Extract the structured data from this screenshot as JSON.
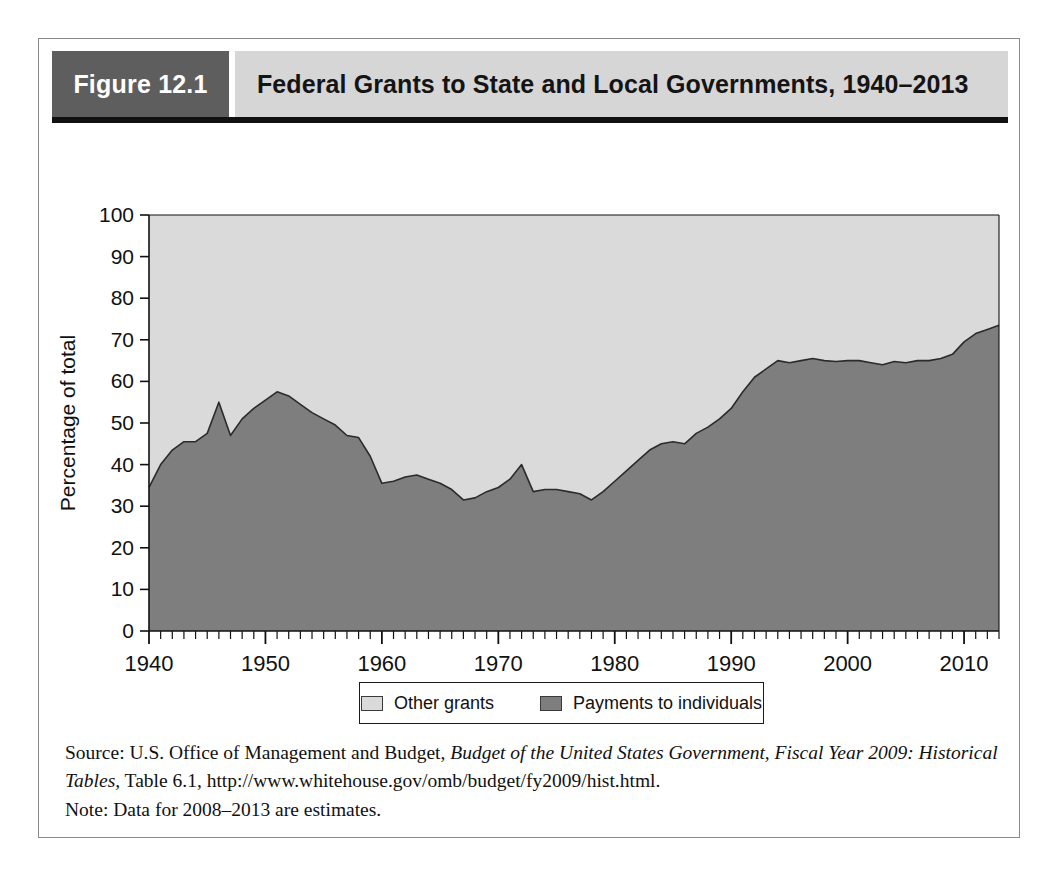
{
  "figure": {
    "number_label": "Figure 12.1",
    "title": "Federal Grants to State and Local Governments, 1940–2013"
  },
  "legend": {
    "items": [
      {
        "label": "Other grants",
        "color": "#dadada",
        "swatch_name": "other-grants-swatch"
      },
      {
        "label": "Payments to individuals",
        "color": "#7e7e7e",
        "swatch_name": "payments-to-individuals-swatch"
      }
    ]
  },
  "source": {
    "prefix": "Source: U.S. Office of Management and Budget, ",
    "italic_title": "Budget of the United States Government, Fiscal Year 2009: Historical Tables,",
    "suffix": " Table 6.1, http://www.whitehouse.gov/omb/budget/fy2009/hist.html.",
    "note": "Note: Data for 2008–2013 are estimates."
  },
  "chart_data": {
    "type": "area",
    "stacked": true,
    "title": "Federal Grants to State and Local Governments, 1940–2013",
    "xlabel": "",
    "ylabel": "Percentage of total",
    "xlim": [
      1940,
      2013
    ],
    "ylim": [
      0,
      100
    ],
    "grid": false,
    "legend_position": "bottom",
    "x_major_ticks": [
      1940,
      1950,
      1960,
      1970,
      1980,
      1990,
      2000,
      2010
    ],
    "x_tick_labels": [
      "1940",
      "1950",
      "1960",
      "1970",
      "1980",
      "1990",
      "2000",
      "2010"
    ],
    "x_minor_tick_interval": 1,
    "y_ticks": [
      0,
      10,
      20,
      30,
      40,
      50,
      60,
      70,
      80,
      90,
      100
    ],
    "y_tick_labels": [
      "0",
      "10",
      "20",
      "30",
      "40",
      "50",
      "60",
      "70",
      "80",
      "90",
      "100"
    ],
    "x": [
      1940,
      1941,
      1942,
      1943,
      1944,
      1945,
      1946,
      1947,
      1948,
      1949,
      1950,
      1951,
      1952,
      1953,
      1954,
      1955,
      1956,
      1957,
      1958,
      1959,
      1960,
      1961,
      1962,
      1963,
      1964,
      1965,
      1966,
      1967,
      1968,
      1969,
      1970,
      1971,
      1972,
      1973,
      1974,
      1975,
      1976,
      1977,
      1978,
      1979,
      1980,
      1981,
      1982,
      1983,
      1984,
      1985,
      1986,
      1987,
      1988,
      1989,
      1990,
      1991,
      1992,
      1993,
      1994,
      1995,
      1996,
      1997,
      1998,
      1999,
      2000,
      2001,
      2002,
      2003,
      2004,
      2005,
      2006,
      2007,
      2008,
      2009,
      2010,
      2011,
      2012,
      2013
    ],
    "series": [
      {
        "name": "Payments to individuals",
        "color": "#7e7e7e",
        "values": [
          34.5,
          40.0,
          43.5,
          45.5,
          45.5,
          47.5,
          55.0,
          47.0,
          51.0,
          53.5,
          55.5,
          57.5,
          56.5,
          54.5,
          52.5,
          51.0,
          49.5,
          47.0,
          46.5,
          42.0,
          35.5,
          36.0,
          37.0,
          37.5,
          36.5,
          35.5,
          34.0,
          31.5,
          32.0,
          33.5,
          34.5,
          36.5,
          40.0,
          33.5,
          34.0,
          34.0,
          33.5,
          33.0,
          31.5,
          33.5,
          36.0,
          38.5,
          41.0,
          43.5,
          45.0,
          45.5,
          45.0,
          47.5,
          49.0,
          51.0,
          53.5,
          57.5,
          61.0,
          63.0,
          65.0,
          64.5,
          65.0,
          65.5,
          65.0,
          64.8,
          65.0,
          65.0,
          64.5,
          64.0,
          64.8,
          64.5,
          65.0,
          65.0,
          65.5,
          66.5,
          69.5,
          71.5,
          72.5,
          73.5
        ]
      },
      {
        "name": "Other grants",
        "color": "#dadada",
        "values": [
          65.5,
          60.0,
          56.5,
          54.5,
          54.5,
          52.5,
          45.0,
          53.0,
          49.0,
          46.5,
          44.5,
          42.5,
          43.5,
          45.5,
          47.5,
          49.0,
          50.5,
          53.0,
          53.5,
          58.0,
          64.5,
          64.0,
          63.0,
          62.5,
          63.5,
          64.5,
          66.0,
          68.5,
          68.0,
          66.5,
          65.5,
          63.5,
          60.0,
          66.5,
          66.0,
          66.0,
          66.5,
          67.0,
          68.5,
          66.5,
          64.0,
          61.5,
          59.0,
          56.5,
          55.0,
          54.5,
          55.0,
          52.5,
          51.0,
          49.0,
          46.5,
          42.5,
          39.0,
          37.0,
          35.0,
          35.5,
          35.0,
          34.5,
          35.0,
          35.2,
          35.0,
          35.0,
          35.5,
          36.0,
          35.2,
          35.5,
          35.0,
          35.0,
          34.5,
          33.5,
          30.5,
          28.5,
          27.5,
          26.5
        ]
      }
    ]
  }
}
